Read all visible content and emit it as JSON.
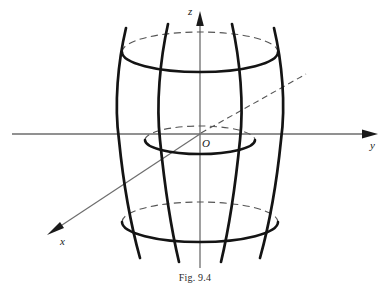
{
  "figure": {
    "caption": "Fig. 9.4",
    "surface_name": "hyperboloid-of-one-sheet",
    "background_color": "#ffffff",
    "curve_color": "#141414",
    "axis_color": "#6d6d6d",
    "dashed_color": "#555555"
  },
  "axes": {
    "z": {
      "label": "z",
      "orientation": "vertical",
      "arrow": "up",
      "tip_x": 200,
      "tip_y": 12,
      "base_x": 200,
      "base_y": 268
    },
    "y": {
      "label": "y",
      "orientation": "horizontal",
      "arrow": "right",
      "tip_x": 378,
      "tip_y": 134,
      "base_x": 12,
      "base_y": 134
    },
    "x": {
      "label": "x",
      "orientation": "oblique",
      "arrow": "down-left",
      "tip_x": 48,
      "tip_y": 234,
      "positive_solid_from": "origin",
      "negative_dashed_to_x": 306,
      "negative_dashed_to_y": 74
    },
    "origin": {
      "label": "O",
      "x": 200,
      "y": 134
    }
  },
  "ellipses": [
    {
      "name": "top-trace",
      "cx": 200,
      "cy": 52,
      "rx": 78,
      "ry": 20,
      "front_style": "solid-bold",
      "back_style": "dashed"
    },
    {
      "name": "waist-trace",
      "cx": 200,
      "cy": 140,
      "rx": 55,
      "ry": 14,
      "front_style": "solid-bold",
      "back_style": "dashed"
    },
    {
      "name": "bottom-trace",
      "cx": 200,
      "cy": 222,
      "rx": 78,
      "ry": 20,
      "front_style": "solid-bold",
      "back_style": "dashed"
    }
  ],
  "hyperbolas": [
    {
      "name": "outer-left",
      "waist_x": 145,
      "top_x": 118,
      "bottom_x": 118,
      "top_y": 30,
      "bottom_y": 256
    },
    {
      "name": "inner-left",
      "waist_x": 178,
      "top_x": 160,
      "bottom_x": 160,
      "top_y": 26,
      "bottom_y": 260
    },
    {
      "name": "inner-right",
      "waist_x": 222,
      "top_x": 240,
      "bottom_x": 240,
      "top_y": 26,
      "bottom_y": 260
    },
    {
      "name": "outer-right",
      "waist_x": 255,
      "top_x": 282,
      "bottom_x": 282,
      "top_y": 30,
      "bottom_y": 256
    }
  ]
}
